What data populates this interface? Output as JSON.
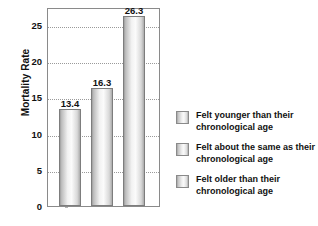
{
  "chart_data": {
    "type": "bar",
    "title": "",
    "xlabel": "",
    "ylabel": "Mortality Rate",
    "ylim": [
      0,
      27.5
    ],
    "grid": true,
    "legend_position": "right",
    "categories": [
      "Felt younger than their chronological age",
      "Felt about the same as their chronological age",
      "Felt older than their chronological age"
    ],
    "values": [
      13.4,
      16.3,
      26.3
    ],
    "value_labels": [
      "13.4",
      "16.3",
      "26.3"
    ],
    "yticks": [
      0,
      5,
      10,
      15,
      20,
      25
    ],
    "ytick_labels": [
      "0",
      "5",
      "10",
      "15",
      "20",
      "25"
    ],
    "series": [
      {
        "name": "Mortality Rate",
        "values": [
          13.4,
          16.3,
          26.3
        ]
      }
    ]
  },
  "axis": {
    "y_title": "Mortality Rate",
    "ticks": [
      {
        "value": 25,
        "label": "25"
      },
      {
        "value": 20,
        "label": "20"
      },
      {
        "value": 15,
        "label": "15"
      },
      {
        "value": 10,
        "label": "10"
      },
      {
        "value": 5,
        "label": "5"
      },
      {
        "value": 0,
        "label": "0"
      }
    ]
  },
  "bars": [
    {
      "value": 13.4,
      "label": "13.4"
    },
    {
      "value": 16.3,
      "label": "16.3"
    },
    {
      "value": 26.3,
      "label": "26.3"
    }
  ],
  "legend": {
    "items": [
      {
        "label": "Felt younger than their chronological age"
      },
      {
        "label": "Felt about the same as their chronological age"
      },
      {
        "label": "Felt older than their chronological age"
      }
    ]
  },
  "colors": {
    "background": "#ffffff",
    "frame": "#8a8a8a",
    "gridline": "#9a9a9a",
    "bar_border": "#7d7d7d",
    "text": "#111111"
  }
}
